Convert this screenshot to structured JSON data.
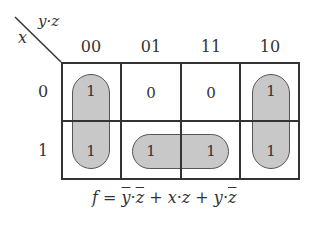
{
  "kmap": {
    "corner_labels": {
      "columns_var": "y·z",
      "rows_var": "x"
    },
    "column_headers": [
      "00",
      "01",
      "11",
      "10"
    ],
    "row_headers": [
      "0",
      "1"
    ],
    "cells": [
      [
        "1",
        "0",
        "0",
        "1"
      ],
      [
        "1",
        "1",
        "1",
        "1"
      ]
    ],
    "groupings": [
      {
        "name": "column-00",
        "cells": [
          [
            0,
            0
          ],
          [
            1,
            0
          ]
        ]
      },
      {
        "name": "row1-01-11",
        "cells": [
          [
            1,
            1
          ],
          [
            1,
            2
          ]
        ]
      },
      {
        "name": "column-10",
        "cells": [
          [
            0,
            3
          ],
          [
            1,
            3
          ]
        ]
      }
    ]
  },
  "formula": {
    "lhs": "f",
    "eq": "=",
    "terms": [
      {
        "parts": [
          {
            "t": "y",
            "bar": true
          },
          {
            "t": "·"
          },
          {
            "t": "z",
            "bar": true
          }
        ]
      },
      {
        "parts": [
          {
            "t": "x"
          },
          {
            "t": "·"
          },
          {
            "t": "z"
          }
        ]
      },
      {
        "parts": [
          {
            "t": "y"
          },
          {
            "t": "·"
          },
          {
            "t": "z",
            "bar": true
          }
        ]
      }
    ],
    "text": "f = ȳ·z̄ + x·z + y·z̄"
  },
  "colors": {
    "grid": "#333333",
    "group_fill": "#c8c8c8"
  }
}
